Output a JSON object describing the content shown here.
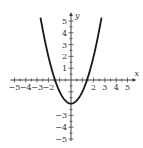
{
  "chart_data": {
    "type": "line",
    "title": "",
    "function": "y = x^2 - 2",
    "xlabel": "x",
    "ylabel": "y",
    "xlim": [
      -5,
      5
    ],
    "ylim": [
      -5,
      5
    ],
    "grid": false,
    "legend": null,
    "x_tick_labels": [
      "-5",
      "-4",
      "-3",
      "-2",
      "2",
      "3",
      "4",
      "5"
    ],
    "y_tick_labels": [
      "5",
      "4",
      "3",
      "2",
      "1",
      "-3",
      "-4",
      "-5"
    ],
    "series": [
      {
        "name": "parabola",
        "x": [
          -2.7,
          -2.5,
          -2,
          -1.5,
          -1.414,
          -1,
          -0.5,
          0,
          0.5,
          1,
          1.414,
          1.5,
          2,
          2.5,
          2.7
        ],
        "y": [
          5.29,
          4.25,
          2,
          0.25,
          0,
          -1,
          -1.75,
          -2,
          -1.75,
          -1,
          0,
          0.25,
          2,
          4.25,
          5.29
        ]
      }
    ],
    "key_points": {
      "vertex": [
        0,
        -2
      ],
      "x_intercepts": [
        -1.414,
        1.414
      ],
      "y_intercept": -2
    }
  }
}
